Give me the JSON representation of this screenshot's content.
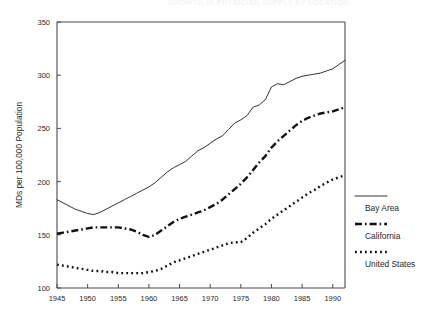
{
  "page": {
    "cut_off_title": "GROWTH IN PHYSICIAN SUPPLY BY LOCATION"
  },
  "chart_data": {
    "type": "line",
    "title": "",
    "xlabel": "",
    "ylabel": "MDs per 100,000 Population",
    "xlim": [
      1945,
      1992
    ],
    "ylim": [
      100,
      350
    ],
    "xticks": [
      1945,
      1950,
      1955,
      1960,
      1965,
      1970,
      1975,
      1980,
      1985,
      1990
    ],
    "yticks": [
      100,
      150,
      200,
      250,
      300,
      350
    ],
    "grid": false,
    "legend_position": "right",
    "series": [
      {
        "name": "Bay Area",
        "style": "solid",
        "x": [
          1945,
          1946,
          1947,
          1948,
          1949,
          1950,
          1951,
          1952,
          1953,
          1954,
          1955,
          1956,
          1957,
          1958,
          1959,
          1960,
          1961,
          1962,
          1963,
          1964,
          1965,
          1966,
          1967,
          1968,
          1969,
          1970,
          1971,
          1972,
          1973,
          1974,
          1975,
          1976,
          1977,
          1978,
          1979,
          1980,
          1981,
          1982,
          1983,
          1984,
          1985,
          1986,
          1987,
          1988,
          1989,
          1990,
          1991,
          1992
        ],
        "values": [
          183,
          180,
          177,
          174,
          172,
          170,
          169,
          171,
          174,
          177,
          180,
          183,
          186,
          189,
          192,
          195,
          199,
          204,
          209,
          213,
          216,
          219,
          224,
          229,
          232,
          236,
          240,
          243,
          249,
          255,
          258,
          262,
          270,
          272,
          277,
          289,
          292,
          291,
          294,
          297,
          299,
          300,
          301,
          302,
          304,
          306,
          310,
          314
        ]
      },
      {
        "name": "California",
        "style": "dashdot",
        "x": [
          1945,
          1946,
          1947,
          1948,
          1949,
          1950,
          1951,
          1952,
          1953,
          1954,
          1955,
          1956,
          1957,
          1958,
          1959,
          1960,
          1961,
          1962,
          1963,
          1964,
          1965,
          1966,
          1967,
          1968,
          1969,
          1970,
          1971,
          1972,
          1973,
          1974,
          1975,
          1976,
          1977,
          1978,
          1979,
          1980,
          1981,
          1982,
          1983,
          1984,
          1985,
          1986,
          1987,
          1988,
          1989,
          1990,
          1991,
          1992
        ],
        "values": [
          151,
          152,
          153,
          154,
          155,
          156,
          157,
          157,
          157,
          157,
          157,
          156,
          155,
          153,
          150,
          148,
          150,
          154,
          158,
          162,
          165,
          167,
          169,
          171,
          173,
          176,
          179,
          183,
          188,
          193,
          198,
          204,
          211,
          218,
          224,
          232,
          238,
          243,
          248,
          253,
          257,
          260,
          262,
          264,
          265,
          266,
          268,
          270
        ]
      },
      {
        "name": "United States",
        "style": "dotted",
        "x": [
          1945,
          1946,
          1947,
          1948,
          1949,
          1950,
          1951,
          1952,
          1953,
          1954,
          1955,
          1956,
          1957,
          1958,
          1959,
          1960,
          1961,
          1962,
          1963,
          1964,
          1965,
          1966,
          1967,
          1968,
          1969,
          1970,
          1971,
          1972,
          1973,
          1974,
          1975,
          1976,
          1977,
          1978,
          1979,
          1980,
          1981,
          1982,
          1983,
          1984,
          1985,
          1986,
          1987,
          1988,
          1989,
          1990,
          1991,
          1992
        ],
        "values": [
          122,
          121,
          120,
          119,
          118,
          117,
          116,
          116,
          115,
          115,
          114,
          114,
          114,
          114,
          114,
          115,
          116,
          118,
          121,
          124,
          126,
          128,
          130,
          132,
          134,
          136,
          138,
          140,
          142,
          143,
          143,
          147,
          152,
          156,
          160,
          165,
          169,
          173,
          177,
          181,
          185,
          189,
          192,
          196,
          199,
          202,
          204,
          206
        ]
      }
    ]
  },
  "legend": {
    "items": [
      {
        "label": "Bay Area",
        "style": "solid"
      },
      {
        "label": "California",
        "style": "dashdot"
      },
      {
        "label": "United States",
        "style": "dotted"
      }
    ]
  }
}
